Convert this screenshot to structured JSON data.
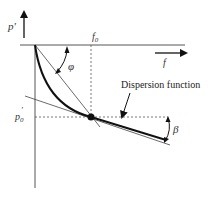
{
  "labels": {
    "y_axis": "p'",
    "x_axis": "f",
    "f0": "f",
    "f0_sub": "0",
    "p0": "p",
    "p0_sub": "0",
    "p0_prime": "'",
    "phi": "φ",
    "beta": "β",
    "annotation": "Dispersion function"
  },
  "colors": {
    "line": "#111111",
    "thin": "#444444",
    "dashed": "#555555"
  }
}
